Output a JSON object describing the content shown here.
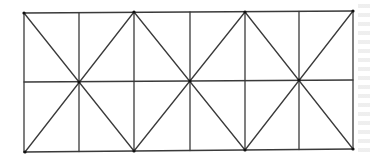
{
  "figure": {
    "stroke_color": "#3a3a3a",
    "node_color": "#111111",
    "background": "#ffffff",
    "grid": {
      "columns": 6,
      "rows": 2,
      "vertical_lines_x": [
        24,
        79,
        134,
        190,
        245,
        299,
        353
      ],
      "top_y": 12,
      "middle_y": 81,
      "bottom_y": 151
    },
    "nodes": [
      {
        "name": "top-left-corner",
        "x": 24,
        "y": 13
      },
      {
        "name": "top-node-1",
        "x": 134,
        "y": 12
      },
      {
        "name": "top-node-2",
        "x": 245,
        "y": 12
      },
      {
        "name": "top-right-corner",
        "x": 353,
        "y": 11
      },
      {
        "name": "center-node-1",
        "x": 79,
        "y": 82
      },
      {
        "name": "center-node-2",
        "x": 190,
        "y": 81
      },
      {
        "name": "center-node-3",
        "x": 299,
        "y": 80
      },
      {
        "name": "bottom-left-corner",
        "x": 25,
        "y": 152
      },
      {
        "name": "bottom-node-1",
        "x": 134,
        "y": 151
      },
      {
        "name": "bottom-node-2",
        "x": 245,
        "y": 150
      },
      {
        "name": "bottom-right-corner",
        "x": 353,
        "y": 149
      }
    ],
    "diagonals": [
      {
        "from": "top-left-corner",
        "to": "bottom-node-1"
      },
      {
        "from": "bottom-left-corner",
        "to": "top-node-1"
      },
      {
        "from": "top-node-1",
        "to": "bottom-node-2"
      },
      {
        "from": "bottom-node-1",
        "to": "top-node-2"
      },
      {
        "from": "top-node-2",
        "to": "bottom-right-corner"
      },
      {
        "from": "bottom-node-2",
        "to": "top-right-corner"
      }
    ]
  }
}
